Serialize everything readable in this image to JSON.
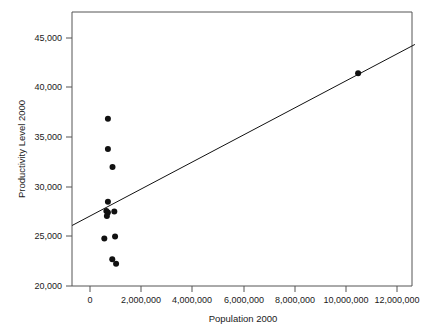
{
  "chart_data": {
    "type": "scatter",
    "title": "",
    "xlabel": "Population 2000",
    "ylabel": "Productivity Level 2000",
    "xlim": [
      -700000,
      12700000
    ],
    "ylim": [
      20000,
      46300
    ],
    "xticks": [
      0,
      2000000,
      4000000,
      6000000,
      8000000,
      10000000,
      12000000
    ],
    "xtick_labels": [
      "0",
      "2,000,000",
      "4,000,000",
      "6,000,000",
      "8,000,000",
      "10,000,000",
      "12,000,000"
    ],
    "yticks": [
      20000,
      25000,
      30000,
      35000,
      40000,
      45000
    ],
    "ytick_labels": [
      "20,000",
      "25,000",
      "30,000",
      "35,000",
      "40,000",
      "45,000"
    ],
    "grid": false,
    "legend": null,
    "marker": "filled-circle",
    "points": [
      {
        "x": 700000,
        "y": 36850
      },
      {
        "x": 700000,
        "y": 33800
      },
      {
        "x": 880000,
        "y": 32000
      },
      {
        "x": 700000,
        "y": 28500
      },
      {
        "x": 640000,
        "y": 27550
      },
      {
        "x": 700000,
        "y": 27400
      },
      {
        "x": 660000,
        "y": 27050
      },
      {
        "x": 950000,
        "y": 27500
      },
      {
        "x": 560000,
        "y": 24800
      },
      {
        "x": 980000,
        "y": 25000
      },
      {
        "x": 870000,
        "y": 22700
      },
      {
        "x": 1020000,
        "y": 22250
      },
      {
        "x": 10480000,
        "y": 41450
      }
    ],
    "fit_line": {
      "type": "linear",
      "x_start": -700000,
      "y_start": 26100,
      "x_end": 12700000,
      "y_end": 44350
    }
  }
}
